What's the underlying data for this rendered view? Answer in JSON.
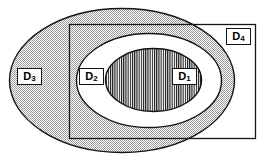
{
  "figure": {
    "background_color": "#ffffff",
    "stroke_color": "#141414",
    "width": 267,
    "height": 163
  },
  "regions": [
    {
      "id": "d1",
      "name": "D1",
      "base": "D",
      "subscript": "1",
      "shape": "ellipse",
      "fill": "vertical-hatch",
      "fill_color": "#ffffff",
      "hatch_color": "#111111",
      "label_box": {
        "x": 172,
        "y": 68,
        "width": 25,
        "height": 17
      }
    },
    {
      "id": "d2",
      "name": "D2",
      "base": "D",
      "subscript": "2",
      "shape": "ellipse",
      "fill": "solid",
      "fill_color": "#ffffff",
      "label_box": {
        "x": 79,
        "y": 68,
        "width": 25,
        "height": 17
      }
    },
    {
      "id": "d3",
      "name": "D3",
      "base": "D",
      "subscript": "3",
      "shape": "ellipse",
      "fill": "stipple",
      "fill_color": "#c8c8c8",
      "label_box": {
        "x": 17,
        "y": 68,
        "width": 25,
        "height": 17
      }
    },
    {
      "id": "d4",
      "name": "D4",
      "base": "D",
      "subscript": "4",
      "shape": "rectangle",
      "fill": "none",
      "fill_color": "#ffffff",
      "label_box": {
        "x": 226,
        "y": 28,
        "width": 25,
        "height": 17
      }
    }
  ],
  "geometry": {
    "d3_ellipse": {
      "cx": 122,
      "cy": 80.5,
      "rx": 113,
      "ry": 72.5
    },
    "d2_ellipse": {
      "cx": 149,
      "cy": 80.5,
      "rx": 73,
      "ry": 47.5
    },
    "d1_ellipse": {
      "cx": 153.5,
      "cy": 80,
      "rx": 48.5,
      "ry": 32
    },
    "d4_rect": {
      "x": 69,
      "y": 24,
      "width": 187,
      "height": 115
    }
  }
}
